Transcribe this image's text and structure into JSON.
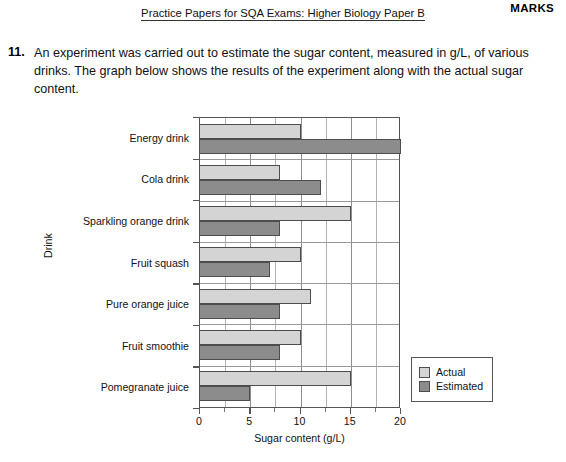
{
  "header": {
    "marks_label": "MARKS",
    "running_head": "Practice Papers for SQA Exams: Higher Biology Paper B"
  },
  "question": {
    "number": "11.",
    "text": "An experiment was carried out to estimate the sugar content, measured in g/L, of various drinks. The graph below shows the results of the experiment along with the actual sugar content."
  },
  "colors": {
    "actual": "#d4d4d4",
    "estimated": "#8c8c8c",
    "axis": "#555555",
    "grid": "#8e8e8e"
  },
  "chart_data": {
    "type": "bar",
    "orientation": "horizontal",
    "title": "",
    "xlabel": "Sugar content (g/L)",
    "ylabel": "Drink",
    "xlim": [
      0,
      20
    ],
    "xticks": [
      0,
      5,
      10,
      15,
      20
    ],
    "xtick_labels": [
      "0",
      "5",
      "10",
      "15",
      "20"
    ],
    "minor_gridline_step": 2.5,
    "grid": true,
    "legend_position": "right",
    "categories": [
      "Energy drink",
      "Cola drink",
      "Sparkling orange drink",
      "Fruit squash",
      "Pure orange juice",
      "Fruit smoothie",
      "Pomegranate juice"
    ],
    "series": [
      {
        "name": "Actual",
        "values": [
          10,
          8,
          15,
          10,
          11,
          10,
          15
        ]
      },
      {
        "name": "Estimated",
        "values": [
          20,
          12,
          8,
          7,
          8,
          8,
          5
        ]
      }
    ]
  }
}
